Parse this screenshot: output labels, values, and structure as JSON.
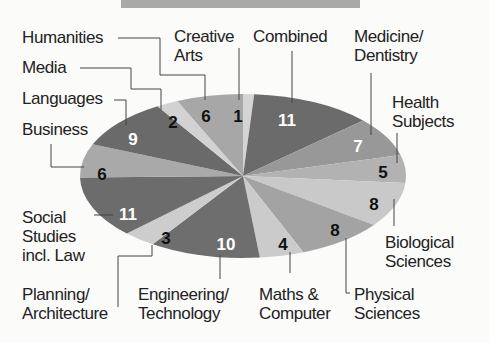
{
  "chart_data": {
    "type": "pie",
    "title": "",
    "total": 91,
    "start_angle_deg": 0,
    "direction": "clockwise",
    "center": [
      243,
      176
    ],
    "rx": 163,
    "ry": 82,
    "slices": [
      {
        "label": "Creative Arts",
        "value": 1,
        "color": "#d4d4d4",
        "value_color": "#111111",
        "value_pos": [
          238,
          118
        ]
      },
      {
        "label": "Combined",
        "value": 11,
        "color": "#6b6b6b",
        "value_color": "#ffffff",
        "value_pos": [
          287,
          122
        ]
      },
      {
        "label": "Medicine/ Dentistry",
        "value": 7,
        "color": "#989898",
        "value_color": "#ffffff",
        "value_pos": [
          358,
          148
        ]
      },
      {
        "label": "Health Subjects",
        "value": 5,
        "color": "#b2b2b2",
        "value_color": "#111111",
        "value_pos": [
          383,
          174
        ]
      },
      {
        "label": "Biological Sciences",
        "value": 8,
        "color": "#c9c9c9",
        "value_color": "#111111",
        "value_pos": [
          374,
          206
        ]
      },
      {
        "label": "Physical Sciences",
        "value": 8,
        "color": "#a3a3a3",
        "value_color": "#111111",
        "value_pos": [
          335,
          232
        ]
      },
      {
        "label": "Maths & Computer",
        "value": 4,
        "color": "#cbcbcb",
        "value_color": "#111111",
        "value_pos": [
          283,
          246
        ]
      },
      {
        "label": "Engineering/ Technology",
        "value": 10,
        "color": "#6e6e6e",
        "value_color": "#ffffff",
        "value_pos": [
          226,
          246
        ]
      },
      {
        "label": "Planning/ Architecture",
        "value": 3,
        "color": "#cdcdcd",
        "value_color": "#111111",
        "value_pos": [
          166,
          240
        ]
      },
      {
        "label": "Social Studies incl. Law",
        "value": 11,
        "color": "#6c6c6c",
        "value_color": "#ffffff",
        "value_pos": [
          128,
          216
        ]
      },
      {
        "label": "Business",
        "value": 6,
        "color": "#a9a9a9",
        "value_color": "#111111",
        "value_pos": [
          102,
          176
        ]
      },
      {
        "label": "Languages",
        "value": 9,
        "color": "#6a6a6a",
        "value_color": "#ffffff",
        "value_pos": [
          133,
          141
        ]
      },
      {
        "label": "Media",
        "value": 2,
        "color": "#d2d2d2",
        "value_color": "#111111",
        "value_pos": [
          173,
          124
        ]
      },
      {
        "label": "Humanities",
        "value": 6,
        "color": "#a7a7a7",
        "value_color": "#111111",
        "value_pos": [
          206,
          118
        ]
      }
    ],
    "legend_position": "callout labels with leader lines"
  },
  "labels": {
    "humanities": "Humanities",
    "media": "Media",
    "languages": "Languages",
    "business": "Business",
    "creative_1": "Creative",
    "creative_2": "Arts",
    "combined": "Combined",
    "medicine_1": "Medicine/",
    "medicine_2": "Dentistry",
    "health_1": "Health",
    "health_2": "Subjects",
    "biological_1": "Biological",
    "biological_2": "Sciences",
    "physical_1": "Physical",
    "physical_2": "Sciences",
    "maths_1": "Maths &",
    "maths_2": "Computer",
    "engineering_1": "Engineering/",
    "engineering_2": "Technology",
    "planning_1": "Planning/",
    "planning_2": "Architecture",
    "social_1": "Social",
    "social_2": "Studies",
    "social_3": "incl. Law"
  }
}
